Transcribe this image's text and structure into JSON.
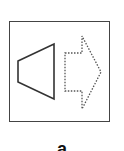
{
  "figure": {
    "label": "a",
    "elements": [
      {
        "name": "frame",
        "shape": "square",
        "style": "solid"
      },
      {
        "name": "speaker-cone",
        "shape": "trapezoid",
        "style": "solid"
      },
      {
        "name": "arrow-right",
        "shape": "block-arrow",
        "style": "dotted"
      }
    ],
    "colors": {
      "stroke": "#333333",
      "background": "#ffffff"
    }
  }
}
